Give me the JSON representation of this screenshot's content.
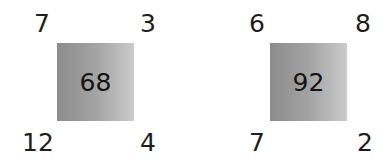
{
  "puzzles": [
    {
      "center": "68",
      "top_left": "7",
      "top_right": "3",
      "bottom_left": "12",
      "bottom_right": "4"
    },
    {
      "center": "92",
      "top_left": "6",
      "top_right": "8",
      "bottom_left": "7",
      "bottom_right": "2"
    }
  ]
}
